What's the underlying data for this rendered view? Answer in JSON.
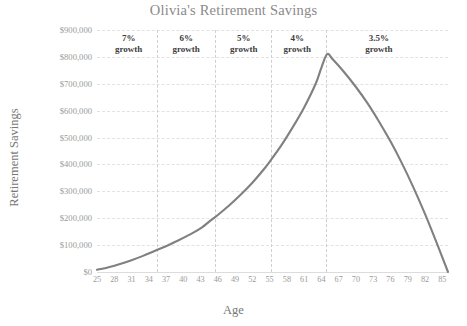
{
  "chart_data": {
    "type": "line",
    "title": "Olivia's Retirement Savings",
    "xlabel": "Age",
    "ylabel": "Retirement Savings",
    "xlim": [
      25,
      86
    ],
    "ylim": [
      0,
      900000
    ],
    "grid": true,
    "legend": "none",
    "x_ticks": [
      25,
      28,
      31,
      34,
      37,
      40,
      43,
      46,
      49,
      52,
      55,
      58,
      61,
      64,
      67,
      70,
      73,
      76,
      79,
      82,
      85
    ],
    "y_ticks": [
      0,
      100000,
      200000,
      300000,
      400000,
      500000,
      600000,
      700000,
      800000,
      900000
    ],
    "y_tick_labels": [
      "$0",
      "$100,000",
      "$200,000",
      "$300,000",
      "$400,000",
      "$500,000",
      "$600,000",
      "$700,000",
      "$800,000",
      "$900,000"
    ],
    "line_color": "#808080",
    "grid_color": "#e2e2e2",
    "divider_color": "#cfcfcf",
    "series": [
      {
        "name": "Retirement Savings",
        "x": [
          25,
          27,
          29,
          31,
          33,
          35,
          37,
          39,
          41,
          43,
          45,
          46,
          48,
          50,
          52,
          54,
          55,
          57,
          59,
          61,
          63,
          64,
          65,
          66,
          68,
          70,
          72,
          74,
          76,
          78,
          80,
          82,
          84,
          86
        ],
        "values": [
          8000,
          18000,
          30000,
          44000,
          60000,
          78000,
          96000,
          116000,
          138000,
          162000,
          196000,
          212000,
          248000,
          288000,
          332000,
          382000,
          410000,
          470000,
          538000,
          612000,
          700000,
          760000,
          810000,
          790000,
          742000,
          688000,
          628000,
          560000,
          486000,
          404000,
          314000,
          216000,
          110000,
          0
        ]
      }
    ],
    "annotations": [
      {
        "label_top": "7%",
        "label_bottom": "growth",
        "x_center": 30.5,
        "phase_start": 25,
        "phase_end": 35.5
      },
      {
        "label_top": "6%",
        "label_bottom": "growth",
        "x_center": 40.5,
        "phase_start": 35.5,
        "phase_end": 45.5
      },
      {
        "label_top": "5%",
        "label_bottom": "growth",
        "x_center": 50.5,
        "phase_start": 45.5,
        "phase_end": 55.3
      },
      {
        "label_top": "4%",
        "label_bottom": "growth",
        "x_center": 59.8,
        "phase_start": 55.3,
        "phase_end": 64.8
      },
      {
        "label_top": "3.5%",
        "label_bottom": "growth",
        "x_center": 74.0,
        "phase_start": 64.8,
        "phase_end": 86
      }
    ],
    "dividers": [
      35.5,
      45.5,
      55.3,
      64.8
    ]
  }
}
